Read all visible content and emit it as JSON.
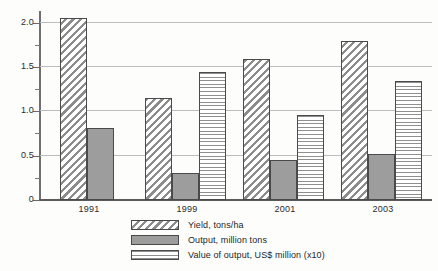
{
  "chart_data": {
    "type": "bar",
    "title": "",
    "xlabel": "",
    "ylabel": "",
    "categories": [
      "1991",
      "1999",
      "2001",
      "2003"
    ],
    "series": [
      {
        "name": "Yield, tons/ha",
        "pattern": "diagonal-hatch",
        "values": [
          2.05,
          1.15,
          1.59,
          1.79
        ]
      },
      {
        "name": "Output, million tons",
        "pattern": "solid-gray",
        "values": [
          0.81,
          0.3,
          0.45,
          0.52
        ]
      },
      {
        "name": "Value of output, US$ million (x10)",
        "pattern": "horizontal-hatch",
        "values": [
          null,
          1.44,
          0.96,
          1.34
        ]
      }
    ],
    "ylim": [
      0,
      2.12
    ],
    "yticks": [
      "0",
      "0.5",
      "1.0",
      "1.5",
      "2.0"
    ],
    "ytick_values": [
      0,
      0.5,
      1.0,
      1.5,
      2.0
    ],
    "yminor_values": [
      0.25,
      0.75,
      1.25,
      1.75
    ],
    "grid": "horizontal",
    "legend_position": "bottom"
  },
  "legend": {
    "items": [
      {
        "label": "Yield, tons/ha"
      },
      {
        "label": "Output, million tons"
      },
      {
        "label": "Value of output, US$ million (x10)"
      }
    ]
  },
  "axis": {
    "ylabels": [
      "2.0",
      "1.5",
      "1.0",
      "0.5",
      "0"
    ],
    "xlabels": [
      "1991",
      "1999",
      "2001",
      "2003"
    ]
  }
}
